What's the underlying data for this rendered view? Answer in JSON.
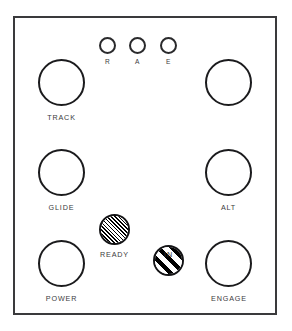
{
  "panel": {
    "title": "Control Panel",
    "background_color": "#ffffff",
    "border_color": "#3a3a3c"
  },
  "indicators": [
    {
      "name": "indicator-r",
      "label": "R",
      "state": "off",
      "shape": "circle"
    },
    {
      "name": "indicator-a",
      "label": "A",
      "state": "off",
      "shape": "circle"
    },
    {
      "name": "indicator-e",
      "label": "E",
      "state": "off",
      "shape": "circle"
    }
  ],
  "knobs": [
    {
      "name": "knob-track",
      "label": "TRACK",
      "position": "top-left"
    },
    {
      "name": "knob-unlabeled",
      "label": "",
      "position": "top-right"
    },
    {
      "name": "knob-glide",
      "label": "GLIDE",
      "position": "middle-left"
    },
    {
      "name": "knob-alt",
      "label": "ALT",
      "position": "middle-right"
    },
    {
      "name": "knob-power",
      "label": "POWER",
      "position": "bottom-left"
    },
    {
      "name": "knob-engage",
      "label": "ENGAGE",
      "position": "bottom-right"
    }
  ],
  "lamps": [
    {
      "name": "lamp-ready",
      "label": "READY",
      "fill": "fine-diagonal-hatch",
      "state": "lit"
    },
    {
      "name": "lamp-in",
      "label": "IN",
      "fill": "coarse-diagonal-stripes",
      "state": "lit"
    }
  ],
  "colors": {
    "outline": "#1b1b1d",
    "label_text": "#3b3b3d",
    "hatch": "#000000",
    "panel_fill": "#ffffff"
  }
}
